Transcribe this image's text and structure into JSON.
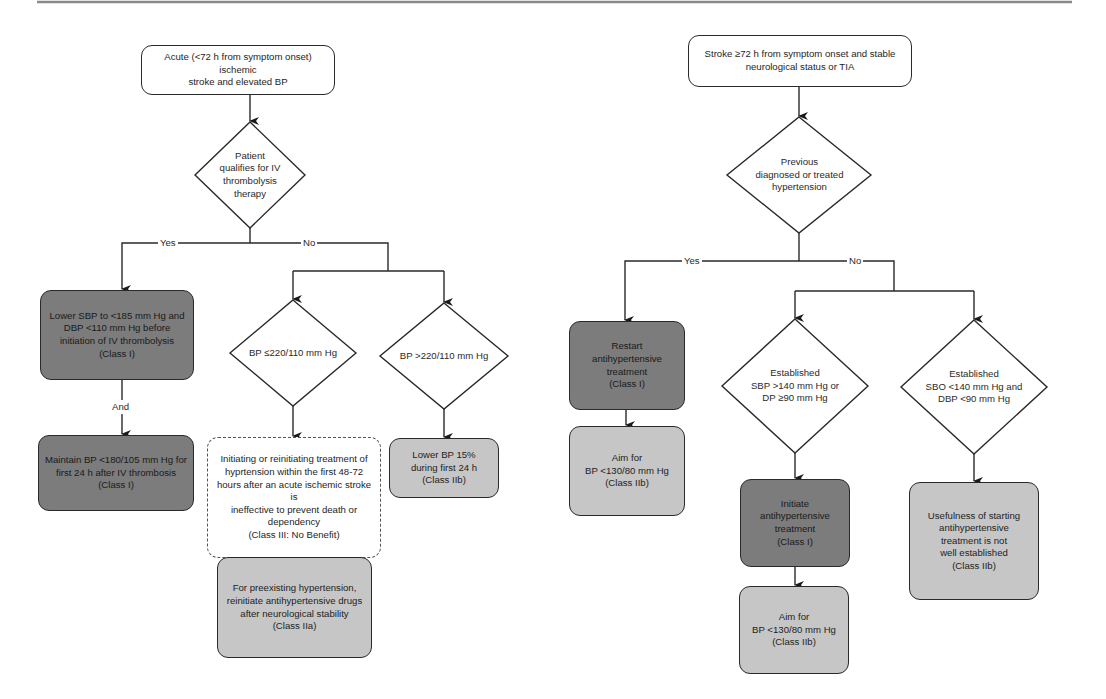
{
  "colors": {
    "line": "#2a2a2a",
    "class_I_fill": "#7c7c7c",
    "class_II_fill": "#c6c6c6",
    "neutral_fill": "#ffffff",
    "top_rule": "#8a8a8a"
  },
  "left_flow": {
    "start": "Acute (<72 h from symptom onset) ischemic\nstroke and elevated BP",
    "decision_thrombolysis": "Patient\nqualifies for IV\nthrombolysis\ntherapy",
    "yes_label": "Yes",
    "no_label": "No",
    "lower_sbp": "Lower SBP to <185 mm Hg and\nDBP <110 mm Hg before\ninitiation of IV thrombolysis\n(Class I)",
    "and_label": "And",
    "maintain_bp": "Maintain BP <180/105 mm Hg for\nfirst 24 h after IV thrombosis\n(Class I)",
    "decision_bp_le": "BP ≤220/110 mm Hg",
    "decision_bp_gt": "BP >220/110 mm Hg",
    "initiating": "Initiating or reinitiating treatment of\nhyprtension within the first 48-72\nhours after an acute ischemic stroke is\nineffective to prevent death or\ndependency\n(Class III: No Benefit)",
    "preexisting": "For preexisting hypertension,\nreinitiate antihypertensive drugs\nafter neurological stability\n(Class IIa)",
    "lower_bp_15": "Lower BP 15%\nduring first 24 h\n(Class IIb)"
  },
  "right_flow": {
    "start": "Stroke ≥72 h from symptom onset and stable\nneurological status or TIA",
    "decision_previous": "Previous\ndiagnosed or treated\nhypertension",
    "yes_label": "Yes",
    "no_label": "No",
    "restart": "Restart\nantihypertensive\ntreatment\n(Class I)",
    "aim_restart": "Aim for\nBP <130/80 mm Hg\n(Class IIb)",
    "decision_established_high": "Established\nSBP >140 mm Hg or\nDP ≥90 mm Hg",
    "decision_established_low": "Established\nSBO <140 mm Hg and\nDBP <90 mm Hg",
    "initiate": "Initiate\nantihypertensive\ntreatment\n(Class I)",
    "aim_initiate": "Aim for\nBP <130/80 mm Hg\n(Class IIb)",
    "usefulness": "Usefulness of starting\nantihypertensive\ntreatment is not\nwell established\n(Class IIb)"
  }
}
